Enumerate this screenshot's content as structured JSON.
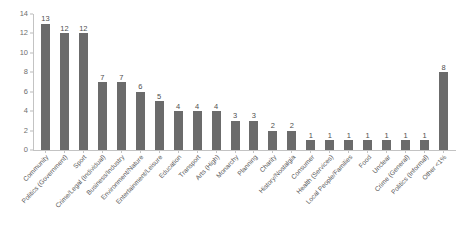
{
  "chart_data": {
    "type": "bar",
    "title": "",
    "subtitle": "",
    "xlabel": "",
    "ylabel": "",
    "ylim": [
      0,
      14
    ],
    "y_ticks": [
      0,
      2,
      4,
      6,
      8,
      10,
      12,
      14
    ],
    "grid": false,
    "legend": false,
    "legend_position": "none",
    "bar_color": "#6b6b6b",
    "background_color": "#ffffff",
    "axis_color": "#c3c3c3",
    "value_labels_shown": true,
    "categories": [
      "Community",
      "Politics (Government)",
      "Sport",
      "Crime/Legal (Individual)",
      "Business/Industry",
      "Environment/Nature",
      "Entertainment/Leisure",
      "Education",
      "Transport",
      "Arts (High)",
      "Monarchy",
      "Planning",
      "Charity",
      "History/Nostalgia",
      "Consumer",
      "Health (Services)",
      "Local People/Families",
      "Food",
      "Unclear",
      "Crime (General)",
      "Politics (Informal)",
      "Other <1%"
    ],
    "values": [
      13,
      12,
      12,
      7,
      7,
      6,
      5,
      4,
      4,
      4,
      3,
      3,
      2,
      2,
      1,
      1,
      1,
      1,
      1,
      1,
      1,
      8
    ]
  }
}
